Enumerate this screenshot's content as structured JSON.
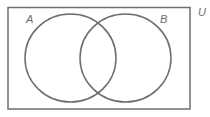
{
  "diagram": {
    "type": "venn",
    "universe_label": "U",
    "sets": [
      {
        "label": "A"
      },
      {
        "label": "B"
      }
    ],
    "colors": {
      "stroke": "#6e6e6e",
      "label": "#6b6b6b",
      "background": "#ffffff"
    }
  }
}
